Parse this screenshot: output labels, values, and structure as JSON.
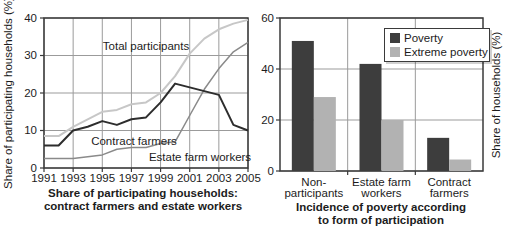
{
  "figure": {
    "left_chart": {
      "ylabel": "Share of participating households (%)",
      "caption_lines": [
        "Share of participating households:",
        "contract farmers and estate workers"
      ],
      "inplot_labels": {
        "total": "Total participants",
        "contract": "Contract farmers",
        "estate": "Estate farm workers"
      }
    },
    "right_chart": {
      "ylabel": "Share of households (%)",
      "caption_lines": [
        "Incidence of poverty according",
        "to form of participation"
      ]
    },
    "colors": {
      "total_line": "#c7c7c7",
      "estate_line": "#8a8a8a",
      "contract_line": "#2d2d2d",
      "poverty_bar": "#3d3d3d",
      "extreme_bar": "#b2b2b2",
      "grid": "#9b9b9b",
      "axis": "#3a3a3a",
      "text": "#1c1c1c"
    }
  },
  "chart_data": [
    {
      "type": "line",
      "title": "Share of participating households: contract farmers and estate workers",
      "ylabel": "Share of participating households (%)",
      "xlabel": "",
      "x": [
        1991,
        1992,
        1993,
        1994,
        1995,
        1996,
        1997,
        1998,
        1999,
        2000,
        2001,
        2002,
        2003,
        2004,
        2005
      ],
      "series": [
        {
          "name": "Total participants",
          "color": "#c7c7c7",
          "values": [
            8.5,
            8.5,
            11,
            13,
            15,
            15.5,
            17,
            17.5,
            20,
            24.5,
            30.5,
            34.5,
            37,
            38.5,
            39.5
          ]
        },
        {
          "name": "Estate farm workers",
          "color": "#8a8a8a",
          "values": [
            2.5,
            2.5,
            2.5,
            3,
            3.5,
            5,
            5.5,
            5.5,
            6.5,
            7,
            14,
            21,
            26.5,
            31,
            33.5
          ]
        },
        {
          "name": "Contract farmers",
          "color": "#2d2d2d",
          "values": [
            6,
            6,
            10,
            11,
            12.5,
            11.5,
            13,
            13.5,
            17.5,
            22.5,
            21.5,
            20.5,
            19.5,
            11.5,
            10
          ]
        }
      ],
      "ylim": [
        0,
        40
      ],
      "ytick_values": [
        0,
        10,
        20,
        30,
        40
      ],
      "xtick_values": [
        1991,
        1993,
        1995,
        1997,
        1999,
        2001,
        2003,
        2005
      ],
      "grid": true,
      "legend_position": "none"
    },
    {
      "type": "bar",
      "title": "Incidence of poverty according to form of participation",
      "ylabel": "Share of households (%)",
      "categories": [
        "Non-participants",
        "Estate farm workers",
        "Contract farmers"
      ],
      "categories_lines": [
        [
          "Non-",
          "participants"
        ],
        [
          "Estate farm",
          "workers"
        ],
        [
          "Contract",
          "farmers"
        ]
      ],
      "series": [
        {
          "name": "Poverty",
          "color": "#3d3d3d",
          "values": [
            51,
            42,
            13
          ]
        },
        {
          "name": "Extreme poverty",
          "color": "#b2b2b2",
          "values": [
            29,
            20,
            4.5
          ]
        }
      ],
      "ylim": [
        0,
        60
      ],
      "ytick_values": [
        0,
        20,
        40,
        60
      ],
      "grid": true,
      "legend_position": "top-right"
    }
  ]
}
